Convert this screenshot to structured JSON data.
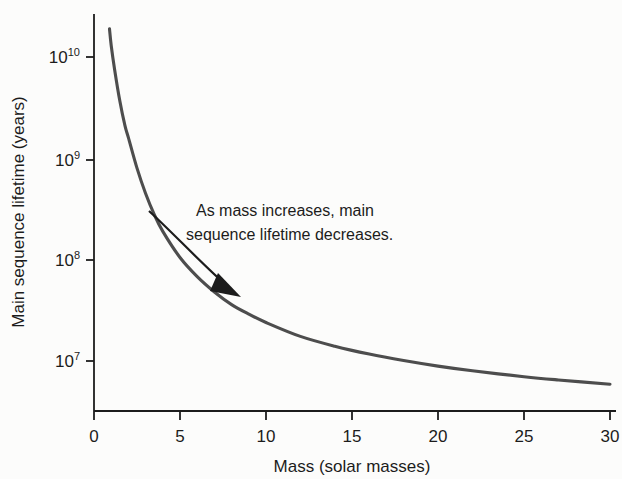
{
  "chart_data": {
    "type": "line",
    "title": "",
    "xlabel": "Mass (solar masses)",
    "ylabel": "Main sequence lifetime (years)",
    "xlim": [
      0,
      31
    ],
    "ylim": [
      4000000,
      30000000000
    ],
    "yscale": "log",
    "xscale": "linear",
    "grid": false,
    "legend": null,
    "xticks": [
      {
        "value": 0,
        "label": "0"
      },
      {
        "value": 5,
        "label": "5"
      },
      {
        "value": 10,
        "label": "10"
      },
      {
        "value": 15,
        "label": "15"
      },
      {
        "value": 20,
        "label": "20"
      },
      {
        "value": 25,
        "label": "25"
      },
      {
        "value": 30,
        "label": "30"
      }
    ],
    "yticks": [
      {
        "value": 10000000000,
        "base": "10",
        "exponent": "10"
      },
      {
        "value": 1000000000,
        "base": "10",
        "exponent": "9"
      },
      {
        "value": 100000000,
        "base": "10",
        "exponent": "8"
      },
      {
        "value": 10000000,
        "base": "10",
        "exponent": "7"
      }
    ],
    "series": [
      {
        "name": "Main sequence lifetime vs mass",
        "color": "#4d4d4d",
        "x": [
          0.9,
          1.0,
          1.2,
          1.5,
          1.8,
          2.0,
          2.5,
          3.0,
          3.5,
          4.0,
          5.0,
          6.0,
          7.0,
          8.0,
          9.0,
          10.0,
          12.0,
          14.0,
          16.0,
          18.0,
          20.0,
          22.0,
          25.0,
          27.0,
          30.0
        ],
        "y": [
          19000000000,
          13000000000,
          7500000000,
          3700000000,
          2100000000,
          1600000000,
          800000000,
          450000000,
          280000000,
          190000000,
          105000000,
          68000000,
          48000000,
          36000000,
          29000000,
          24000000,
          17500000,
          14000000,
          11700000,
          10100000,
          8900000,
          8000000,
          7000000,
          6500000,
          5900000
        ]
      }
    ],
    "annotations": [
      {
        "name": "trend-annotation",
        "line1": "As mass increases, main",
        "line2": "sequence lifetime decreases.",
        "arrow": "curved-arrow-down-right"
      }
    ],
    "colors": {
      "curve": "#4d4d4d",
      "axis": "#1c1c1c",
      "text": "#1c1c1c",
      "background": "#fcfcfb"
    }
  }
}
